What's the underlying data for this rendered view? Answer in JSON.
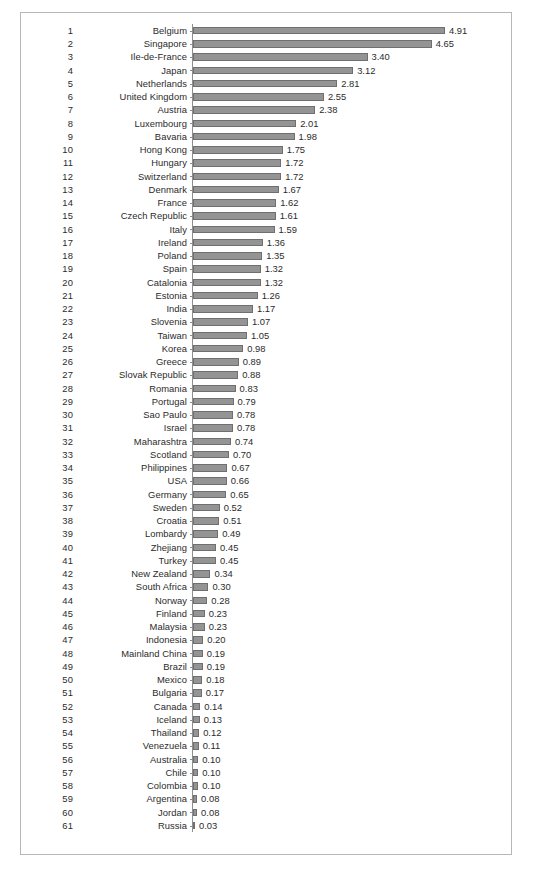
{
  "chart_data": {
    "type": "bar",
    "orientation": "horizontal",
    "title": "",
    "subtitle": "",
    "xlabel": "",
    "ylabel": "",
    "xlim": [
      0,
      4.91
    ],
    "grid": false,
    "legend": null,
    "value_labels": true,
    "ranks": [
      1,
      2,
      3,
      4,
      5,
      6,
      7,
      8,
      9,
      10,
      11,
      12,
      13,
      14,
      15,
      16,
      17,
      18,
      19,
      20,
      21,
      22,
      23,
      24,
      25,
      26,
      27,
      28,
      29,
      30,
      31,
      32,
      33,
      34,
      35,
      36,
      37,
      38,
      39,
      40,
      41,
      42,
      43,
      44,
      45,
      46,
      47,
      48,
      49,
      50,
      51,
      52,
      53,
      54,
      55,
      56,
      57,
      58,
      59,
      60,
      61
    ],
    "categories": [
      "Belgium",
      "Singapore",
      "Ile-de-France",
      "Japan",
      "Netherlands",
      "United Kingdom",
      "Austria",
      "Luxembourg",
      "Bavaria",
      "Hong Kong",
      "Hungary",
      "Switzerland",
      "Denmark",
      "France",
      "Czech Republic",
      "Italy",
      "Ireland",
      "Poland",
      "Spain",
      "Catalonia",
      "Estonia",
      "India",
      "Slovenia",
      "Taiwan",
      "Korea",
      "Greece",
      "Slovak Republic",
      "Romania",
      "Portugal",
      "Sao Paulo",
      "Israel",
      "Maharashtra",
      "Scotland",
      "Philippines",
      "USA",
      "Germany",
      "Sweden",
      "Croatia",
      "Lombardy",
      "Zhejiang",
      "Turkey",
      "New Zealand",
      "South Africa",
      "Norway",
      "Finland",
      "Malaysia",
      "Indonesia",
      "Mainland China",
      "Brazil",
      "Mexico",
      "Bulgaria",
      "Canada",
      "Iceland",
      "Thailand",
      "Venezuela",
      "Australia",
      "Chile",
      "Colombia",
      "Argentina",
      "Jordan",
      "Russia"
    ],
    "values": [
      4.91,
      4.65,
      3.4,
      3.12,
      2.81,
      2.55,
      2.38,
      2.01,
      1.98,
      1.75,
      1.72,
      1.72,
      1.67,
      1.62,
      1.61,
      1.59,
      1.36,
      1.35,
      1.32,
      1.32,
      1.26,
      1.17,
      1.07,
      1.05,
      0.98,
      0.89,
      0.88,
      0.83,
      0.79,
      0.78,
      0.78,
      0.74,
      0.7,
      0.67,
      0.66,
      0.65,
      0.52,
      0.51,
      0.49,
      0.45,
      0.45,
      0.34,
      0.3,
      0.28,
      0.23,
      0.23,
      0.2,
      0.19,
      0.19,
      0.18,
      0.17,
      0.14,
      0.13,
      0.12,
      0.11,
      0.1,
      0.1,
      0.1,
      0.08,
      0.08,
      0.03
    ],
    "value_label_strings": [
      "4.91",
      "4.65",
      "3.40",
      "3.12",
      "2.81",
      "2.55",
      "2.38",
      "2.01",
      "1.98",
      "1.75",
      "1.72",
      "1.72",
      "1.67",
      "1.62",
      "1.61",
      "1.59",
      "1.36",
      "1.35",
      "1.32",
      "1.32",
      "1.26",
      "1.17",
      "1.07",
      "1.05",
      "0.98",
      "0.89",
      "0.88",
      "0.83",
      "0.79",
      "0.78",
      "0.78",
      "0.74",
      "0.70",
      "0.67",
      "0.66",
      "0.65",
      "0.52",
      "0.51",
      "0.49",
      "0.45",
      "0.45",
      "0.34",
      "0.30",
      "0.28",
      "0.23",
      "0.23",
      "0.20",
      "0.19",
      "0.19",
      "0.18",
      "0.17",
      "0.14",
      "0.13",
      "0.12",
      "0.11",
      "0.10",
      "0.10",
      "0.10",
      "0.08",
      "0.08",
      "0.03"
    ]
  },
  "style": {
    "bar_fill": "#949494",
    "bar_stroke": "#6f6f6f",
    "axis_color": "#8e8e8e",
    "frame_color": "#b7b7b7",
    "text_color": "#2b2b2b",
    "background": "#ffffff"
  }
}
